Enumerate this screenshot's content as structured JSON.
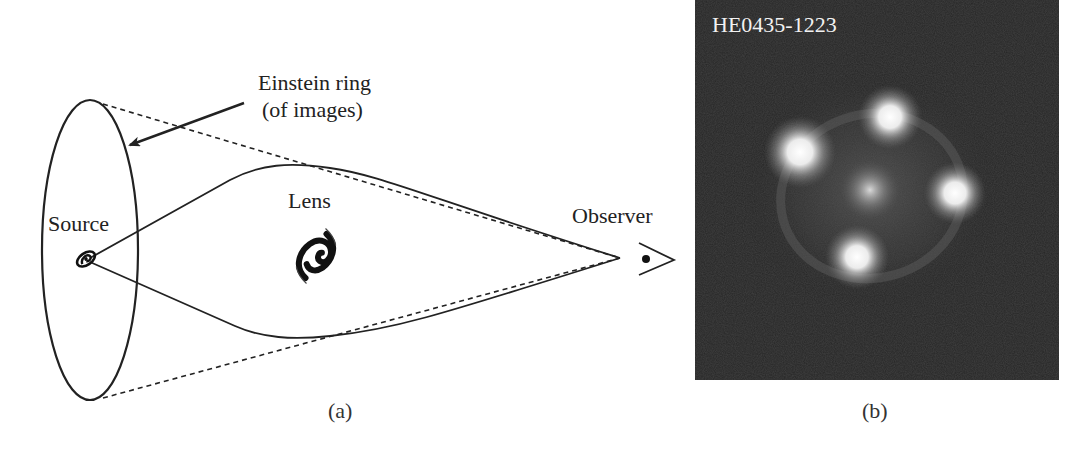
{
  "panel_a": {
    "labels": {
      "einstein_ring_line1": "Einstein ring",
      "einstein_ring_line2": "(of images)",
      "source": "Source",
      "lens": "Lens",
      "observer": "Observer"
    },
    "caption": "(a)"
  },
  "panel_b": {
    "object_name": "HE0435-1223",
    "caption": "(b)",
    "image_count": 4,
    "colors": {
      "background": "#262626",
      "glow": "#ffffff"
    }
  }
}
